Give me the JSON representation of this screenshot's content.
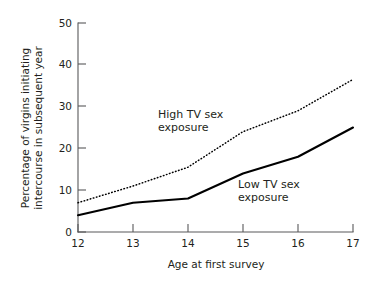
{
  "chart_data": {
    "type": "line",
    "title": "",
    "subtitle": "",
    "xlabel": "Age at first survey",
    "ylabel": "Percentage of virgins initiating intercourse in subsequent year",
    "ylabel_line1": "Percentage of virgins initiating",
    "ylabel_line2": "intercourse in subsequent year",
    "x": [
      12,
      13,
      14,
      15,
      16,
      17
    ],
    "xticklabels": [
      "12",
      "13",
      "14",
      "15",
      "16",
      "17"
    ],
    "yticks": [
      0,
      10,
      20,
      30,
      40,
      50
    ],
    "yticklabels": [
      "0",
      "10",
      "20",
      "30",
      "40",
      "50"
    ],
    "xlim": [
      12,
      17
    ],
    "ylim": [
      0,
      50
    ],
    "grid": false,
    "legend_position": "inline-annotation",
    "series": [
      {
        "name": "High TV sex exposure",
        "style": "dotted",
        "label_line1": "High TV sex",
        "label_line2": "exposure",
        "values": [
          7,
          11,
          15.5,
          24,
          29,
          36.5
        ]
      },
      {
        "name": "Low TV sex exposure",
        "style": "solid",
        "label_line1": "Low TV sex",
        "label_line2": "exposure",
        "values": [
          4,
          7,
          8,
          14,
          18,
          25
        ]
      }
    ],
    "annotations": [
      {
        "text": "High TV sex exposure",
        "x": 14.0,
        "y": 27.5
      },
      {
        "text": "Low TV sex exposure",
        "x": 15.4,
        "y": 12.0
      }
    ],
    "colors": {
      "line": "#000000",
      "axis": "#58585a",
      "text": "#231f20",
      "background": "#ffffff"
    }
  }
}
